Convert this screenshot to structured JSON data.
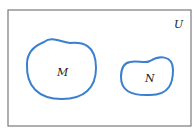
{
  "diagram": {
    "type": "venn",
    "universe_label": "U",
    "sets": [
      {
        "label": "M"
      },
      {
        "label": "N"
      }
    ],
    "relationship": "disjoint",
    "colors": {
      "border": "#7a7a7a",
      "set_outline": "#3a7fd0",
      "text": "#222222",
      "background": "#ffffff"
    }
  }
}
